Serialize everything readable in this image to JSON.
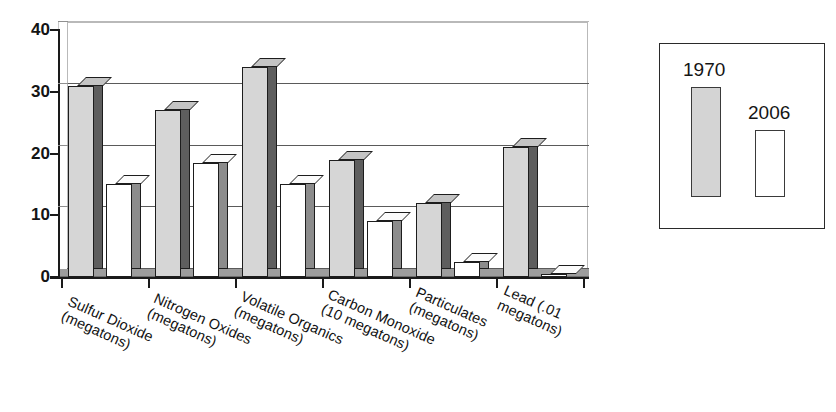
{
  "chart_data": {
    "type": "bar",
    "title": "",
    "subtitle": "",
    "xlabel": "",
    "ylabel": "",
    "ylim": [
      0,
      40
    ],
    "ytick_labels": [
      "0",
      "10",
      "20",
      "30",
      "40"
    ],
    "ytick_values": [
      0,
      10,
      20,
      30,
      40
    ],
    "grid": true,
    "grid_axis": "y",
    "legend_position": "right",
    "style": "3d-bar",
    "categories": [
      "Sulfur Dioxide (megatons)",
      "Nitrogen Oxides (megatons)",
      "Volatile Organics (megatons)",
      "Carbon Monoxide (10 megatons)",
      "Particulates (megatons)",
      "Lead (.01 megatons)"
    ],
    "category_lines": [
      [
        "Sulfur Dioxide",
        "(megatons)"
      ],
      [
        "Nitrogen Oxides",
        "(megatons)"
      ],
      [
        "Volatile Organics",
        "(megatons)"
      ],
      [
        "Carbon Monoxide",
        "(10 megatons)"
      ],
      [
        "Particulates",
        "(megatons)"
      ],
      [
        "Lead (.01",
        "megatons)"
      ]
    ],
    "series": [
      {
        "name": "1970",
        "color": "#d6d6d6",
        "values": [
          31,
          27,
          34,
          19,
          12,
          21
        ]
      },
      {
        "name": "2006",
        "color": "#ffffff",
        "values": [
          15,
          18.5,
          15,
          9,
          2.5,
          0.5
        ]
      }
    ]
  },
  "legend": {
    "entries": [
      {
        "label": "1970",
        "swatch": "filled-grey-bar"
      },
      {
        "label": "2006",
        "swatch": "empty-white-bar"
      }
    ]
  },
  "colors": {
    "series_1970_fill": "#d6d6d6",
    "series_2006_fill": "#ffffff",
    "bar_outline": "#1d1d1d",
    "bar_side_1970": "#5e5e5e",
    "bar_side_2006": "#8c8c8c",
    "axis": "#1a1a1a",
    "gridline": "#5a5a5a",
    "floor": "#9d9d9d",
    "legend_border": "#2a2a2a",
    "background": "#ffffff"
  }
}
